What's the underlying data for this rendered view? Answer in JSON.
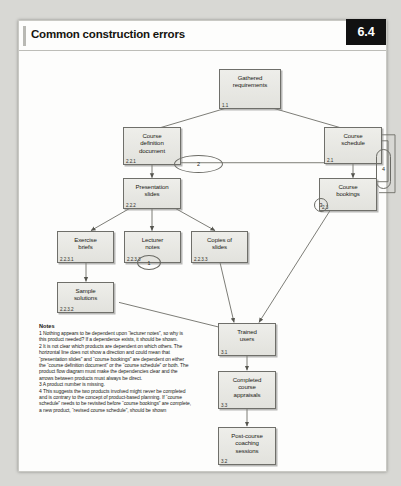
{
  "header": {
    "title": "Common construction errors",
    "chapter_badge": "6.4"
  },
  "diagram": {
    "nodes": [
      {
        "id": "gathered-requirements",
        "label": "Gathered\nrequirements",
        "number": "1.1"
      },
      {
        "id": "course-definition-document",
        "label": "Course\ndefinition\ndocument",
        "number": "2.2.1"
      },
      {
        "id": "course-schedule",
        "label": "Course\nschedule",
        "number": "2.1"
      },
      {
        "id": "presentation-slides",
        "label": "Presentation\nslides",
        "number": "2.2.2"
      },
      {
        "id": "course-bookings",
        "label": "Course\nbookings",
        "number": "2.3"
      },
      {
        "id": "exercise-briefs",
        "label": "Exercise\nbriefs",
        "number": "2.2.3.1"
      },
      {
        "id": "lecturer-notes",
        "label": "Lecturer\nnotes",
        "number": "2.2.3.3"
      },
      {
        "id": "copies-of-slides",
        "label": "Copies of\nslides",
        "number": "2.2.3.3"
      },
      {
        "id": "sample-solutions",
        "label": "Sample\nsolutions",
        "number": "2.2.3.2"
      },
      {
        "id": "trained-users",
        "label": "Trained\nusers",
        "number": "3.1"
      },
      {
        "id": "completed-course-appraisals",
        "label": "Completed\ncourse\nappraisals",
        "number": "3.3"
      },
      {
        "id": "post-course-coaching-sessions",
        "label": "Post-course\ncoaching\nsessions",
        "number": "3.2"
      }
    ],
    "markers": [
      {
        "id": "marker-1",
        "label": "1"
      },
      {
        "id": "marker-2",
        "label": "2"
      },
      {
        "id": "marker-3",
        "label": "3"
      },
      {
        "id": "marker-4",
        "label": "4"
      }
    ]
  },
  "notes": {
    "title": "Notes",
    "items": [
      "1 Nothing appears to be dependent upon “lecturer notes”, so why is this product needed? If a dependence exists, it should be shown.",
      "2 It is not clear which products are dependent on which others. The horizontal line does not show a direction and could mean that “presentation slides” and “course bookings” are dependent on either the “course definition document” or the “course schedule” or both. The product flow diagram must make the dependencies clear and the arrows between products must always be direct.",
      "3 A product number is missing.",
      "4 This suggests the two products involved might never be completed and is contrary to the concept of product-based planning. If “course schedule” needs to be revisited before “course bookings” are complete, a new product, “revised course schedule”, should be shown"
    ]
  }
}
